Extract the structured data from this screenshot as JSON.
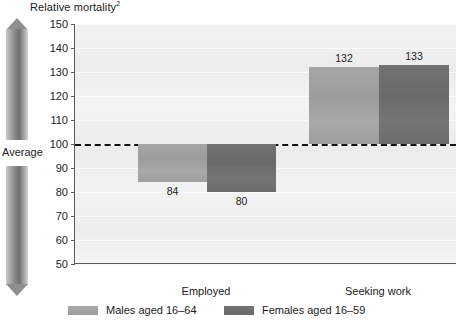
{
  "chart_data": {
    "type": "bar",
    "title": "Relative mortality",
    "title_superscript": "2",
    "xlabel": "",
    "ylabel": "Relative mortality",
    "categories": [
      "Employed",
      "Seeking work"
    ],
    "series": [
      {
        "name": "Males aged 16–64",
        "color": "#a0a0a0",
        "values": [
          84,
          132
        ]
      },
      {
        "name": "Females aged 16–59",
        "color": "#6e6e6e",
        "values": [
          80,
          133
        ]
      }
    ],
    "ylim": [
      50,
      150
    ],
    "yticks": [
      150,
      140,
      130,
      120,
      110,
      100,
      90,
      80,
      70,
      60,
      50
    ],
    "ytick_labels": [
      "150",
      "140",
      "130",
      "120",
      "110",
      "100",
      "90",
      "80",
      "70",
      "60",
      "50"
    ],
    "baseline": 100,
    "baseline_label": "Average",
    "baseline_style": "dashed",
    "grid": true,
    "legend_position": "bottom"
  },
  "annotations": {
    "upper_arrow_label": "Higher than average",
    "lower_arrow_label": "Lower than average",
    "average_label": "Average"
  },
  "bar_value_labels": {
    "employed_male": "84",
    "employed_female": "80",
    "seeking_male": "132",
    "seeking_female": "133"
  },
  "legend": {
    "items": [
      {
        "label": "Males aged 16–64"
      },
      {
        "label": "Females aged 16–59"
      }
    ]
  }
}
